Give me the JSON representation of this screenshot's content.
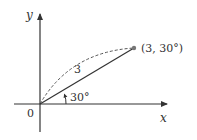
{
  "diagram": {
    "axes": {
      "x_label": "x",
      "y_label": "y",
      "origin_label": "0"
    },
    "vector": {
      "length_label": "3",
      "angle_label": "30°",
      "point_label": "(3, 30°)"
    },
    "colors": {
      "line": "#333333",
      "point": "#777777",
      "arc": "#555555"
    }
  }
}
